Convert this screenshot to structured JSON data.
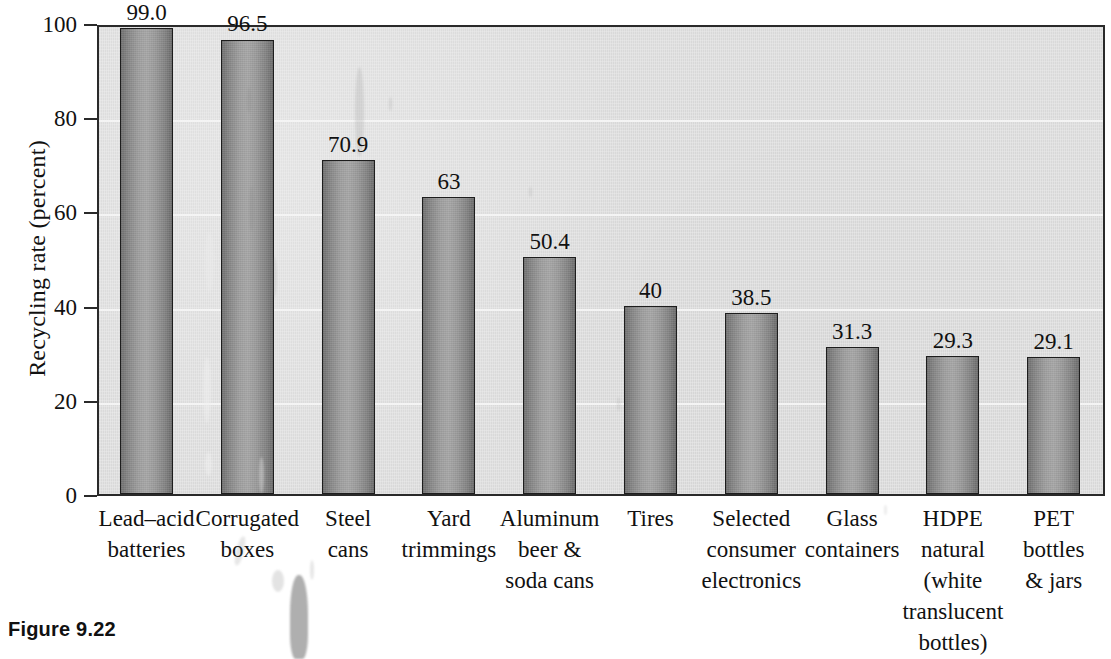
{
  "caption": "Figure 9.22",
  "chart_data": {
    "type": "bar",
    "title": "",
    "xlabel": "",
    "ylabel": "Recycling rate (percent)",
    "ylim": [
      0,
      100
    ],
    "yticks": [
      0,
      20,
      40,
      60,
      80,
      100
    ],
    "ytick_labels": [
      "0",
      "20",
      "40",
      "60",
      "80",
      "100"
    ],
    "grid": true,
    "grid_axis": "y",
    "legend": "none",
    "value_labels_shown": true,
    "categories": [
      "Lead–acid batteries",
      "Corrugated boxes",
      "Steel cans",
      "Yard trimmings",
      "Aluminum beer & soda cans",
      "Tires",
      "Selected consumer electronics",
      "Glass containers",
      "HDPE natural (white translucent bottles)",
      "PET bottles & jars"
    ],
    "category_lines": [
      [
        "Lead–acid",
        "batteries"
      ],
      [
        "Corrugated",
        "boxes"
      ],
      [
        "Steel",
        "cans"
      ],
      [
        "Yard",
        "trimmings"
      ],
      [
        "Aluminum",
        "beer &",
        "soda cans"
      ],
      [
        "Tires"
      ],
      [
        "Selected",
        "consumer",
        "electronics"
      ],
      [
        "Glass",
        "containers"
      ],
      [
        "HDPE",
        "natural",
        "(white",
        "translucent",
        "bottles)"
      ],
      [
        "PET",
        "bottles",
        "& jars"
      ]
    ],
    "values": [
      99.0,
      96.5,
      70.9,
      63,
      50.4,
      40,
      38.5,
      31.3,
      29.3,
      29.1
    ],
    "value_label_text": [
      "99.0",
      "96.5",
      "70.9",
      "63",
      "50.4",
      "40",
      "38.5",
      "31.3",
      "29.3",
      "29.1"
    ]
  },
  "colors": {
    "plot_background": "#dddddd",
    "bar_fill": "#9a9a9a",
    "bar_edge": "#1d1d1d",
    "gridline": "#f4f4f4",
    "axis": "#2a2a2a",
    "text": "#111111",
    "page_background": "#ffffff"
  }
}
